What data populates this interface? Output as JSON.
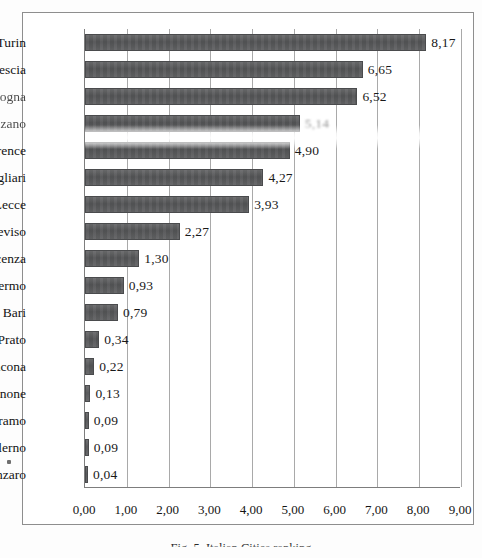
{
  "chart_data": {
    "type": "bar",
    "orientation": "horizontal",
    "title": "",
    "xlabel": "",
    "ylabel": "",
    "xlim": [
      0,
      9
    ],
    "xticks": [
      "0,00",
      "1,00",
      "2,00",
      "3,00",
      "4,00",
      "5,00",
      "6,00",
      "7,00",
      "8,00",
      "9,00"
    ],
    "grid": true,
    "legend": "none",
    "decimal_separator": ",",
    "bar_color": "#58595b",
    "categories": [
      "Turin",
      "Brescia",
      "Bologna",
      "Bolzano",
      "Florence",
      "Cagliari",
      "Lecce",
      "Treviso",
      "Piacenza",
      "Palermo",
      "Bari",
      "Prato",
      "Ancona",
      "Frosinone",
      "Teramo",
      "Salerno",
      "Catanzaro"
    ],
    "values": [
      8.17,
      6.65,
      6.52,
      5.14,
      4.9,
      4.27,
      3.93,
      2.27,
      1.3,
      0.93,
      0.79,
      0.34,
      0.22,
      0.13,
      0.09,
      0.09,
      0.04
    ],
    "value_labels": [
      "8,17",
      "6,65",
      "6,52",
      "5,14",
      "4,90",
      "4,27",
      "3,93",
      "2,27",
      "1,30",
      "0,93",
      "0,79",
      "0,34",
      "0,22",
      "0,13",
      "0,09",
      "0,09",
      "0,04"
    ],
    "degraded_labels": [
      "Bologna",
      "Bolzano"
    ]
  },
  "caption": {
    "text": "Fig. 5. Italian Cities ranking"
  }
}
